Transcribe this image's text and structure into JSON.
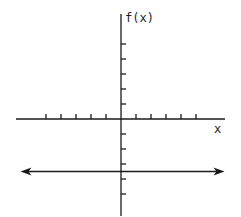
{
  "chart_data": {
    "type": "line",
    "title": "",
    "xlabel": "x",
    "ylabel": "f(x)",
    "x_ticks": [
      -5,
      -4,
      -3,
      -2,
      -1,
      1,
      2,
      3,
      4,
      5
    ],
    "y_ticks": [
      -5,
      -4,
      -3,
      -2,
      -1,
      1,
      2,
      3,
      4,
      5
    ],
    "tick_labels_shown": false,
    "grid": false,
    "series": [
      {
        "name": "f(x)",
        "description": "constant horizontal line with arrows at both ends",
        "x": [
          -6.7,
          6.9
        ],
        "y": [
          -3.5,
          -3.5
        ]
      }
    ],
    "xlim": [
      -7,
      7
    ],
    "ylim": [
      -6,
      6.5
    ]
  },
  "labels": {
    "y_axis": "f(x)",
    "x_axis": "x"
  },
  "colors": {
    "ink": "#1a1a1a",
    "background": "#ffffff"
  }
}
